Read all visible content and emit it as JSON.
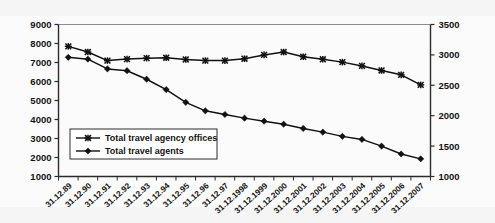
{
  "chart_data": {
    "type": "line",
    "title": "",
    "xlabel": "",
    "ylabel": "",
    "grid": false,
    "legend_position": "inside-bottom-left",
    "categories": [
      "31.12.89",
      "31.12.90",
      "31.12.91",
      "31.12.92",
      "31.12.93",
      "31.12.94",
      "31.12.95",
      "31.12.96",
      "31.12.97",
      "31.12.1998",
      "31.12.1999",
      "31.12.2000",
      "31.12.2001",
      "31.12.2002",
      "31.12.2003",
      "31.12.2004",
      "31.12.2005",
      "31.12.2006",
      "31.12.2007"
    ],
    "axes": {
      "left": {
        "min": 1000,
        "max": 9000,
        "step": 1000,
        "ticks": [
          "1000",
          "2000",
          "3000",
          "4000",
          "5000",
          "6000",
          "7000",
          "8000",
          "9000"
        ]
      },
      "right": {
        "min": 1000,
        "max": 3500,
        "step": 500,
        "ticks": [
          "1000",
          "1500",
          "2000",
          "2500",
          "3000",
          "3500"
        ]
      }
    },
    "series": [
      {
        "name": "Total travel agency offices",
        "axis": "left",
        "marker": "x-star",
        "color": "#111111",
        "values": [
          7850,
          7550,
          7100,
          7180,
          7230,
          7250,
          7160,
          7100,
          7100,
          7200,
          7400,
          7550,
          7300,
          7170,
          7020,
          6820,
          6580,
          6350,
          5820
        ]
      },
      {
        "name": "Total travel agents",
        "axis": "right",
        "marker": "diamond",
        "color": "#111111",
        "values": [
          2960,
          2930,
          2770,
          2740,
          2600,
          2430,
          2220,
          2080,
          2020,
          1960,
          1910,
          1860,
          1790,
          1730,
          1660,
          1610,
          1500,
          1370,
          1290
        ]
      }
    ]
  },
  "legend": {
    "items": [
      {
        "label": "Total travel agency offices"
      },
      {
        "label": "Total travel agents"
      }
    ]
  }
}
